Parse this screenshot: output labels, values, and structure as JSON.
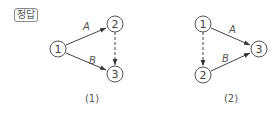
{
  "badge": "정답",
  "panels": [
    {
      "caption": "(1)",
      "nodes": [
        {
          "id": "1",
          "x": 58,
          "y": 49
        },
        {
          "id": "2",
          "x": 115,
          "y": 24
        },
        {
          "id": "3",
          "x": 115,
          "y": 74
        }
      ],
      "edges": [
        {
          "from": "1",
          "to": "2",
          "label": "A",
          "style": "solid"
        },
        {
          "from": "1",
          "to": "3",
          "label": "B",
          "style": "solid"
        },
        {
          "from": "2",
          "to": "3",
          "label": "",
          "style": "dashed"
        }
      ]
    },
    {
      "caption": "(2)",
      "nodes": [
        {
          "id": "1",
          "x": 203,
          "y": 24
        },
        {
          "id": "2",
          "x": 203,
          "y": 75
        },
        {
          "id": "3",
          "x": 259,
          "y": 49
        }
      ],
      "edges": [
        {
          "from": "1",
          "to": "3",
          "label": "A",
          "style": "solid"
        },
        {
          "from": "2",
          "to": "3",
          "label": "B",
          "style": "solid"
        },
        {
          "from": "1",
          "to": "2",
          "label": "",
          "style": "dashed"
        }
      ]
    }
  ]
}
